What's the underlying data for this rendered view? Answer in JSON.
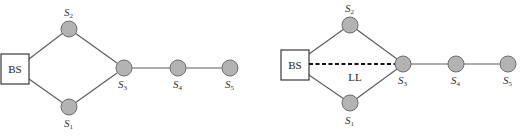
{
  "diagrams": [
    {
      "name": "topology-without-long-link",
      "base_station": {
        "label": "BS"
      },
      "nodes": [
        {
          "id": "S1",
          "letter": "S",
          "sub": "1"
        },
        {
          "id": "S2",
          "letter": "S",
          "sub": "2"
        },
        {
          "id": "S3",
          "letter": "S",
          "sub": "3"
        },
        {
          "id": "S4",
          "letter": "S",
          "sub": "4"
        },
        {
          "id": "S5",
          "letter": "S",
          "sub": "5"
        }
      ],
      "edges": [
        [
          "BS",
          "S2"
        ],
        [
          "BS",
          "S1"
        ],
        [
          "S2",
          "S3"
        ],
        [
          "S1",
          "S3"
        ],
        [
          "S3",
          "S4"
        ],
        [
          "S4",
          "S5"
        ]
      ]
    },
    {
      "name": "topology-with-long-link",
      "base_station": {
        "label": "BS"
      },
      "long_link": {
        "label": "LL",
        "from": "BS",
        "to": "S3",
        "style": "dashed"
      },
      "nodes": [
        {
          "id": "S1",
          "letter": "S",
          "sub": "1"
        },
        {
          "id": "S2",
          "letter": "S",
          "sub": "2"
        },
        {
          "id": "S3",
          "letter": "S",
          "sub": "3"
        },
        {
          "id": "S4",
          "letter": "S",
          "sub": "4"
        },
        {
          "id": "S5",
          "letter": "S",
          "sub": "5"
        }
      ],
      "edges": [
        [
          "BS",
          "S2"
        ],
        [
          "BS",
          "S1"
        ],
        [
          "S2",
          "S3"
        ],
        [
          "S1",
          "S3"
        ],
        [
          "S3",
          "S4"
        ],
        [
          "S4",
          "S5"
        ]
      ]
    }
  ],
  "colors": {
    "node_fill": "#b3b3b3",
    "edge": "#5a5a5a",
    "long_link": "#111111"
  }
}
